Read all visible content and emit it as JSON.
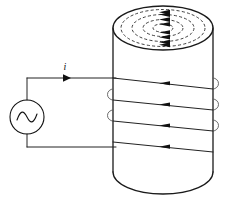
{
  "figure": {
    "background_color": "#ffffff",
    "line_color": "#111111",
    "dashed_line_color": "#2a2a2a",
    "loop_color": "#5a5a5a",
    "width": 226,
    "height": 200
  },
  "labels": {
    "current_label": "i",
    "ac_source_symbol": "∿"
  },
  "source": {
    "type": "ac-voltage-source",
    "center_x": 27,
    "center_y": 117,
    "radius": 17
  },
  "cylinder": {
    "left_x": 113,
    "right_x": 213,
    "top_center_y": 28,
    "bottom_center_y": 172,
    "ellipse_ry": 22
  },
  "circuit": {
    "top_wire_y": 78,
    "bottom_wire_y": 147,
    "left_wire_x": 27
  },
  "field_lines": {
    "count": 4,
    "style": "dashed",
    "direction": "clockwise-viewed-from-top",
    "radii_rx": [
      42,
      31,
      20,
      10
    ],
    "radii_ry": [
      18.5,
      13.5,
      8.5,
      4.2
    ]
  },
  "winding": {
    "turns": 4,
    "current_direction": "leftward",
    "front_line_ys": [
      83,
      104,
      125,
      146
    ],
    "arrow_positions": [
      164,
      164,
      164,
      164
    ]
  }
}
